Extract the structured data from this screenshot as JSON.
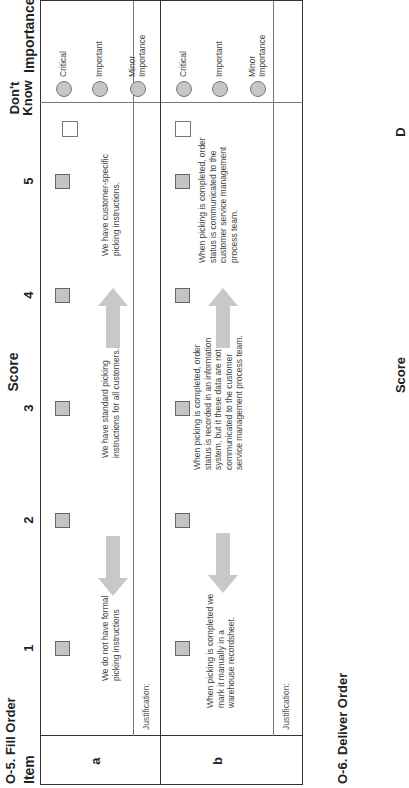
{
  "section1": {
    "title": "O-5. Fill Order",
    "headers": {
      "item": "Item",
      "score": "Score",
      "score_cols": [
        "1",
        "2",
        "3",
        "4",
        "5"
      ],
      "dont_know": "Don't Know",
      "importance": "Importance"
    },
    "importance_options": [
      "Critical",
      "Important",
      "Minor Importance"
    ],
    "rows": [
      {
        "item": "a",
        "descriptions": {
          "score1": "We do not have formal picking instructions",
          "score3": "We have standard picking instructions for all customers.",
          "score5": "We have customer-specific picking instructions."
        },
        "justification_label": "Justification:"
      },
      {
        "item": "b",
        "descriptions": {
          "score1": "When picking is completed we mark it manually in a warehouse recordsheet.",
          "score3": "When picking is completed, order status is recorded in an information system, but it these data are not communicated to the customer service management process team.",
          "score5": "When picking is completed, order status is communicated to the customer service management process team."
        },
        "justification_label": "Justification:"
      }
    ]
  },
  "section2": {
    "title": "O-6.  Deliver Order",
    "partial_headers": [
      "Score",
      "D"
    ]
  },
  "colors": {
    "checkbox_fill": "#c4c4c4",
    "arrow_fill": "#c8c8c8",
    "border": "#333333",
    "text": "#222222"
  }
}
